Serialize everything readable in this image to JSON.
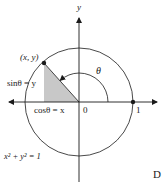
{
  "diagram": {
    "type": "unit-circle",
    "axes": {
      "y_label": "y",
      "origin_label": "0",
      "unit_label": "1"
    },
    "point_label": "(x, y)",
    "angle_label": "θ",
    "sin_label": "sinθ = y",
    "cos_label": "cosθ = x",
    "equation_label": "x² + y² = 1",
    "corner_label": "D",
    "colors": {
      "stroke": "#1a1a1a",
      "shade": "#c8c8c8",
      "background": "#ffffff"
    }
  }
}
